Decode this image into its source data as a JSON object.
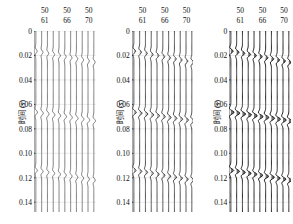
{
  "figure": {
    "type": "seismic-wiggle-gathers",
    "panel_count": 3,
    "background": "#ffffff",
    "trace_color": "#1a1a1a",
    "grid_color": "#c9c9c9"
  },
  "axis": {
    "y_label": "时间 (s)",
    "y_ticks": [
      0,
      0.02,
      0.04,
      0.06,
      0.08,
      0.1,
      0.12,
      0.14
    ],
    "y_tick_labels": [
      "0",
      "0.02",
      "0.04",
      "0.06",
      "0.08",
      "0.10",
      "0.12",
      "0.14"
    ],
    "y_min": 0,
    "y_max": 0.148,
    "y_direction": "downward"
  },
  "header": {
    "row1_label": "50",
    "columns": [
      {
        "top": "50",
        "bottom": "61",
        "position_frac": 0.17
      },
      {
        "top": "50",
        "bottom": "66",
        "position_frac": 0.52
      },
      {
        "top": "50",
        "bottom": "70",
        "position_frac": 0.86
      }
    ]
  },
  "panels": [
    {
      "id": "panel-1",
      "name": "left-panel",
      "trace_count": 11,
      "amplitude_scale": 0.62,
      "line_width": 0.55,
      "fill_opacity": 0.0,
      "events": [
        {
          "time": 0.0165,
          "label": "shallow-event",
          "amplitude": 0.8,
          "freq": 120,
          "moveout": 0.0009
        },
        {
          "time": 0.0665,
          "label": "mid-event",
          "amplitude": 1.0,
          "freq": 115,
          "moveout": 0.0007
        },
        {
          "time": 0.114,
          "label": "deep-event",
          "amplitude": 0.88,
          "freq": 125,
          "moveout": 0.0008
        }
      ]
    },
    {
      "id": "panel-2",
      "name": "middle-panel",
      "trace_count": 11,
      "amplitude_scale": 0.86,
      "line_width": 0.75,
      "fill_opacity": 0.3,
      "events": [
        {
          "time": 0.0165,
          "label": "shallow-event",
          "amplitude": 0.8,
          "freq": 120,
          "moveout": 0.0009
        },
        {
          "time": 0.0665,
          "label": "mid-event",
          "amplitude": 1.05,
          "freq": 115,
          "moveout": 0.0007
        },
        {
          "time": 0.114,
          "label": "deep-event",
          "amplitude": 0.95,
          "freq": 125,
          "moveout": 0.0008
        }
      ]
    },
    {
      "id": "panel-3",
      "name": "right-panel",
      "trace_count": 11,
      "amplitude_scale": 1.05,
      "line_width": 0.95,
      "fill_opacity": 0.62,
      "events": [
        {
          "time": 0.0165,
          "label": "shallow-event",
          "amplitude": 0.82,
          "freq": 120,
          "moveout": 0.0009
        },
        {
          "time": 0.0665,
          "label": "mid-event",
          "amplitude": 1.12,
          "freq": 115,
          "moveout": 0.0007
        },
        {
          "time": 0.114,
          "label": "deep-event",
          "amplitude": 1.02,
          "freq": 125,
          "moveout": 0.0008
        }
      ]
    }
  ],
  "chart_data": {
    "type": "line",
    "title": "",
    "xlabel": "",
    "ylabel": "时间 (s)",
    "ylim": [
      0,
      0.148
    ],
    "grid": true,
    "legend": "none",
    "categories": [
      "50/61",
      "50/66",
      "50/70"
    ],
    "series": [
      {
        "name": "shallow-event-time",
        "values": [
          0.0165,
          0.0165,
          0.0165
        ]
      },
      {
        "name": "mid-event-time",
        "values": [
          0.0665,
          0.0665,
          0.0665
        ]
      },
      {
        "name": "deep-event-time",
        "values": [
          0.114,
          0.114,
          0.114
        ]
      },
      {
        "name": "panel-amplitude-scale",
        "values": [
          0.62,
          0.86,
          1.05
        ]
      }
    ]
  }
}
